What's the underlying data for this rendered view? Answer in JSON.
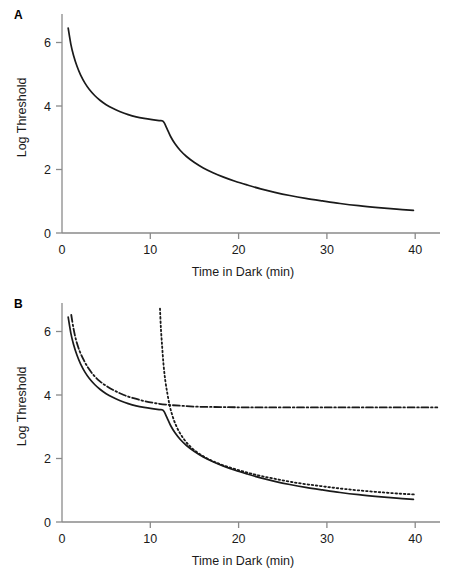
{
  "figure": {
    "panels": [
      {
        "id": "A",
        "label": "A",
        "chart_index": 0
      },
      {
        "id": "B",
        "label": "B",
        "chart_index": 1
      }
    ]
  },
  "chart_data": [
    {
      "type": "line",
      "title": "",
      "panel_label": "A",
      "xlabel": "Time in Dark (min)",
      "ylabel": "Log Threshold",
      "xlim": [
        0,
        43
      ],
      "ylim": [
        0,
        6.9
      ],
      "xticks": [
        0,
        10,
        20,
        30,
        40
      ],
      "yticks": [
        0,
        2,
        4,
        6
      ],
      "xtick_labels": [
        "0",
        "10",
        "20",
        "30",
        "40"
      ],
      "ytick_labels": [
        "0",
        "2",
        "4",
        "6"
      ],
      "grid": false,
      "legend": "none",
      "series": [
        {
          "name": "dark adaptation curve",
          "style": "solid",
          "color": "#1a1a1a",
          "points": [
            [
              0.7,
              6.45
            ],
            [
              1.0,
              5.95
            ],
            [
              1.3,
              5.6
            ],
            [
              1.7,
              5.25
            ],
            [
              2.1,
              4.98
            ],
            [
              2.6,
              4.72
            ],
            [
              3.1,
              4.52
            ],
            [
              3.7,
              4.33
            ],
            [
              4.3,
              4.18
            ],
            [
              5.0,
              4.04
            ],
            [
              5.8,
              3.92
            ],
            [
              6.6,
              3.82
            ],
            [
              7.5,
              3.73
            ],
            [
              8.4,
              3.66
            ],
            [
              9.3,
              3.61
            ],
            [
              10.2,
              3.57
            ],
            [
              11.0,
              3.54
            ],
            [
              11.4,
              3.53
            ],
            [
              11.6,
              3.46
            ],
            [
              11.9,
              3.28
            ],
            [
              12.3,
              3.04
            ],
            [
              12.8,
              2.81
            ],
            [
              13.4,
              2.6
            ],
            [
              14.1,
              2.41
            ],
            [
              15.0,
              2.22
            ],
            [
              16.0,
              2.05
            ],
            [
              17.1,
              1.9
            ],
            [
              18.3,
              1.76
            ],
            [
              19.6,
              1.63
            ],
            [
              21.0,
              1.51
            ],
            [
              22.5,
              1.39
            ],
            [
              24.1,
              1.28
            ],
            [
              25.8,
              1.18
            ],
            [
              27.6,
              1.09
            ],
            [
              29.5,
              1.01
            ],
            [
              31.5,
              0.93
            ],
            [
              33.6,
              0.86
            ],
            [
              35.8,
              0.8
            ],
            [
              37.9,
              0.75
            ],
            [
              39.8,
              0.71
            ]
          ]
        }
      ]
    },
    {
      "type": "line",
      "title": "",
      "panel_label": "B",
      "xlabel": "Time in Dark (min)",
      "ylabel": "Log Threshold",
      "xlim": [
        0,
        43
      ],
      "ylim": [
        0,
        6.9
      ],
      "xticks": [
        0,
        10,
        20,
        30,
        40
      ],
      "yticks": [
        0,
        2,
        4,
        6
      ],
      "xtick_labels": [
        "0",
        "10",
        "20",
        "30",
        "40"
      ],
      "ytick_labels": [
        "0",
        "2",
        "4",
        "6"
      ],
      "grid": false,
      "legend": "none",
      "series": [
        {
          "name": "combined dark adaptation curve",
          "style": "solid",
          "color": "#1a1a1a",
          "points": [
            [
              0.7,
              6.45
            ],
            [
              1.0,
              5.95
            ],
            [
              1.3,
              5.6
            ],
            [
              1.7,
              5.25
            ],
            [
              2.1,
              4.98
            ],
            [
              2.6,
              4.72
            ],
            [
              3.1,
              4.52
            ],
            [
              3.7,
              4.33
            ],
            [
              4.3,
              4.18
            ],
            [
              5.0,
              4.04
            ],
            [
              5.8,
              3.92
            ],
            [
              6.6,
              3.82
            ],
            [
              7.5,
              3.73
            ],
            [
              8.4,
              3.66
            ],
            [
              9.3,
              3.61
            ],
            [
              10.2,
              3.57
            ],
            [
              11.0,
              3.54
            ],
            [
              11.4,
              3.53
            ],
            [
              11.6,
              3.46
            ],
            [
              11.9,
              3.28
            ],
            [
              12.3,
              3.04
            ],
            [
              12.8,
              2.81
            ],
            [
              13.4,
              2.6
            ],
            [
              14.1,
              2.41
            ],
            [
              15.0,
              2.22
            ],
            [
              16.0,
              2.05
            ],
            [
              17.1,
              1.9
            ],
            [
              18.3,
              1.76
            ],
            [
              19.6,
              1.63
            ],
            [
              21.0,
              1.51
            ],
            [
              22.5,
              1.39
            ],
            [
              24.1,
              1.28
            ],
            [
              25.8,
              1.18
            ],
            [
              27.6,
              1.09
            ],
            [
              29.5,
              1.01
            ],
            [
              31.5,
              0.93
            ],
            [
              33.6,
              0.86
            ],
            [
              35.8,
              0.8
            ],
            [
              37.9,
              0.75
            ],
            [
              39.8,
              0.71
            ]
          ]
        },
        {
          "name": "rod branch",
          "style": "dotted",
          "color": "#1a1a1a",
          "points": [
            [
              11.1,
              6.72
            ],
            [
              11.2,
              6.1
            ],
            [
              11.35,
              5.5
            ],
            [
              11.5,
              4.95
            ],
            [
              11.7,
              4.45
            ],
            [
              11.95,
              4.02
            ],
            [
              12.2,
              3.66
            ],
            [
              12.5,
              3.35
            ],
            [
              12.9,
              3.05
            ],
            [
              13.4,
              2.78
            ],
            [
              14.0,
              2.54
            ],
            [
              14.7,
              2.33
            ],
            [
              15.5,
              2.16
            ],
            [
              16.4,
              2.01
            ],
            [
              17.4,
              1.88
            ],
            [
              18.5,
              1.76
            ],
            [
              19.8,
              1.65
            ],
            [
              21.2,
              1.54
            ],
            [
              22.7,
              1.44
            ],
            [
              24.3,
              1.35
            ],
            [
              26.0,
              1.26
            ],
            [
              27.9,
              1.18
            ],
            [
              29.9,
              1.11
            ],
            [
              32.0,
              1.04
            ],
            [
              34.2,
              0.98
            ],
            [
              36.4,
              0.93
            ],
            [
              38.4,
              0.89
            ],
            [
              39.9,
              0.87
            ]
          ]
        },
        {
          "name": "cone branch",
          "style": "dashdot",
          "color": "#1a1a1a",
          "points": [
            [
              1.05,
              6.52
            ],
            [
              1.3,
              6.1
            ],
            [
              1.6,
              5.72
            ],
            [
              2.0,
              5.38
            ],
            [
              2.5,
              5.08
            ],
            [
              3.0,
              4.84
            ],
            [
              3.6,
              4.62
            ],
            [
              4.3,
              4.43
            ],
            [
              5.1,
              4.27
            ],
            [
              6.0,
              4.13
            ],
            [
              7.0,
              4.0
            ],
            [
              8.1,
              3.9
            ],
            [
              9.3,
              3.81
            ],
            [
              10.6,
              3.74
            ],
            [
              12.0,
              3.69
            ],
            [
              13.5,
              3.66
            ],
            [
              15.5,
              3.63
            ],
            [
              18.0,
              3.62
            ],
            [
              21.0,
              3.61
            ],
            [
              25.0,
              3.61
            ],
            [
              30.0,
              3.61
            ],
            [
              35.0,
              3.61
            ],
            [
              40.0,
              3.61
            ],
            [
              42.5,
              3.61
            ]
          ]
        }
      ]
    }
  ]
}
